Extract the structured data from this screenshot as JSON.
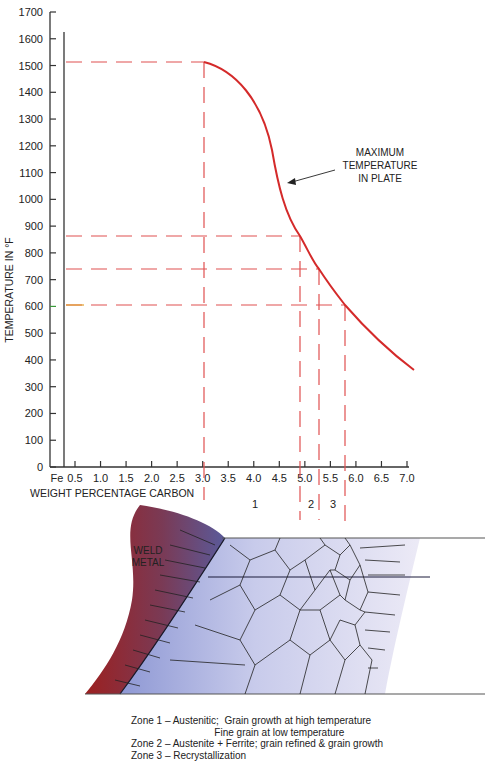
{
  "chart_data": {
    "type": "line",
    "title": "",
    "xlabel": "WEIGHT PERCENTAGE CARBON",
    "ylabel": "TEMPERATURE IN °F",
    "xlim": [
      0,
      7.0
    ],
    "ylim": [
      0,
      1700
    ],
    "x_tick_labels": [
      "Fe",
      "0.5",
      "1.0",
      "1.5",
      "2.0",
      "2.5",
      "3.0",
      "3.5",
      "4.0",
      "4.5",
      "5.0",
      "5.5",
      "6.0",
      "6.5",
      "7.0"
    ],
    "y_tick_labels": [
      "0",
      "100",
      "200",
      "300",
      "400",
      "500",
      "600",
      "700",
      "800",
      "900",
      "1000",
      "1100",
      "1200",
      "1300",
      "1400",
      "1500",
      "1600",
      "1700"
    ],
    "grid": false,
    "series": [
      {
        "name": "Maximum temperature in plate",
        "color": "#d42a2a",
        "x": [
          3.0,
          3.5,
          4.0,
          4.3,
          4.5,
          4.7,
          4.9,
          5.3,
          5.8,
          6.5,
          7.15
        ],
        "y": [
          1500,
          1450,
          1320,
          1180,
          1050,
          950,
          860,
          735,
          600,
          470,
          360
        ]
      }
    ],
    "reference_lines": [
      {
        "type": "horizontal",
        "y": 1500,
        "to_x": 3.0
      },
      {
        "type": "horizontal",
        "y": 860,
        "to_x": 4.9
      },
      {
        "type": "horizontal",
        "y": 735,
        "to_x": 5.3
      },
      {
        "type": "horizontal",
        "y": 600,
        "to_x": 5.8
      },
      {
        "type": "vertical",
        "x": 3.0
      },
      {
        "type": "vertical",
        "x": 4.9
      },
      {
        "type": "vertical",
        "x": 5.3
      },
      {
        "type": "vertical",
        "x": 5.8
      }
    ],
    "annotations": [
      {
        "text": "MAXIMUM TEMPERATURE IN PLATE",
        "points_to": [
          4.4,
          1100
        ]
      }
    ],
    "zone_labels": [
      "1",
      "2",
      "3"
    ]
  },
  "chart": {
    "ylabel": "TEMPERATURE IN °F",
    "xlabel": "WEIGHT PERCENTAGE CARBON",
    "annotation_lines": [
      "MAXIMUM",
      "TEMPERATURE",
      "IN PLATE"
    ],
    "zones": {
      "z1": "1",
      "z2": "2",
      "z3": "3"
    },
    "colors": {
      "curve": "#d42a2a",
      "dash": "#e05050",
      "axis": "#333333"
    }
  },
  "diagram": {
    "weld_label_1": "WELD",
    "weld_label_2": "METAL"
  },
  "caption": {
    "line1": "Zone 1 – Austenitic;  Grain growth at high temperature",
    "line2": "                              Fine grain at low temperature",
    "line3": "Zone 2 – Austenite + Ferrite; grain refined & grain growth",
    "line4": "Zone 3 – Recrystallization"
  }
}
